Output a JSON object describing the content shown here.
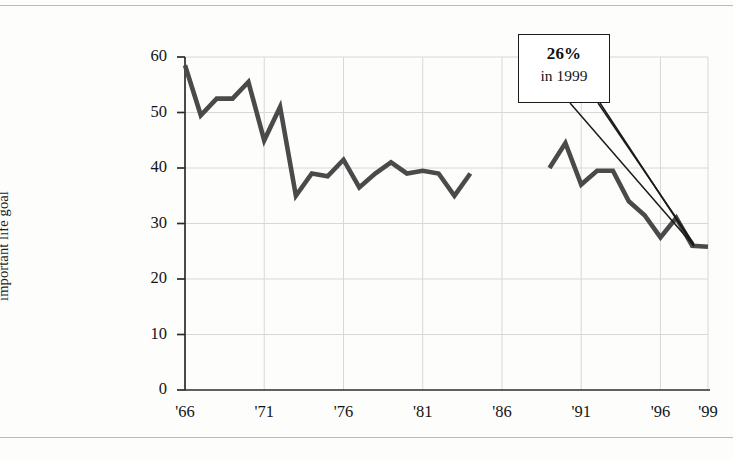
{
  "figure": {
    "name": "political-affairs-life-goal-line-chart",
    "has_top_rule": true,
    "has_bottom_rule": true
  },
  "axis": {
    "y_label": "Percentage saying that\nkeeping up-to-date with\npolitical affairs is a very\nimportant life goal",
    "y_ticks": [
      "0",
      "10",
      "20",
      "30",
      "40",
      "50",
      "60"
    ],
    "x_ticks": [
      "'66",
      "'71",
      "'76",
      "'81",
      "'86",
      "'91",
      "'96",
      "'99"
    ]
  },
  "callout": {
    "value": "26%",
    "subtitle": "in 1999"
  },
  "colors": {
    "line": "#4a4a4a",
    "grid": "#d8d8d8",
    "axis": "#2b2b2b",
    "text": "#151515",
    "rule": "#b9b9b9",
    "background": "#fdfdfc"
  },
  "chart_data": {
    "type": "line",
    "title": "",
    "xlabel": "",
    "ylabel": "Percentage saying that keeping up-to-date with political affairs is a very important life goal",
    "xlim": [
      1966,
      1999
    ],
    "ylim": [
      0,
      60
    ],
    "grid": true,
    "legend": "none",
    "y_tick_values": [
      0,
      10,
      20,
      30,
      40,
      50,
      60
    ],
    "x_tick_values": [
      1966,
      1971,
      1976,
      1981,
      1986,
      1991,
      1996,
      1999
    ],
    "x_tick_labels": [
      "'66",
      "'71",
      "'76",
      "'81",
      "'86",
      "'91",
      "'96",
      "'99"
    ],
    "annotations": [
      {
        "text": "26% in 1999",
        "x": 1999,
        "y": 26,
        "style": "callout-box-with-pointer"
      }
    ],
    "series": [
      {
        "name": "1966-1984",
        "x": [
          1966,
          1967,
          1968,
          1969,
          1970,
          1971,
          1972,
          1973,
          1974,
          1975,
          1976,
          1977,
          1978,
          1979,
          1980,
          1981,
          1982,
          1983,
          1984
        ],
        "values": [
          58.5,
          49.5,
          52.5,
          52.5,
          55.5,
          45.0,
          51.0,
          35.0,
          39.0,
          38.5,
          41.5,
          36.5,
          39.0,
          41.0,
          39.0,
          39.5,
          39.0,
          35.0,
          39.0
        ]
      },
      {
        "name": "1989-1999",
        "x": [
          1989,
          1990,
          1991,
          1992,
          1993,
          1994,
          1995,
          1996,
          1997,
          1998,
          1999
        ],
        "values": [
          40.0,
          44.5,
          37.0,
          39.5,
          39.5,
          34.0,
          31.5,
          27.5,
          31.0,
          26.0,
          25.8
        ]
      }
    ]
  }
}
